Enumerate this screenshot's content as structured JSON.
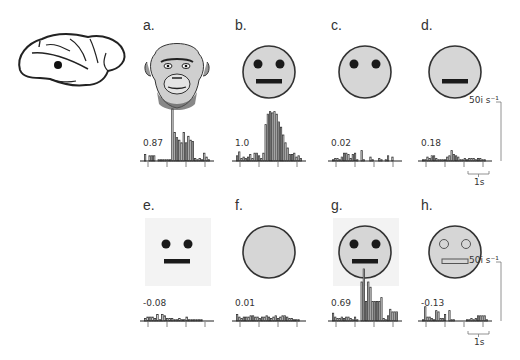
{
  "figure": {
    "panels": [
      {
        "label": "a.",
        "stimulus": "chimpanzee face photo",
        "correlation": "0.87"
      },
      {
        "label": "b.",
        "stimulus": "cartoon face with eyes and mouth",
        "correlation": "1.0"
      },
      {
        "label": "c.",
        "stimulus": "cartoon face eyes only",
        "correlation": "0.02"
      },
      {
        "label": "d.",
        "stimulus": "cartoon face mouth only",
        "correlation": "0.18"
      },
      {
        "label": "e.",
        "stimulus": "eyes and mouth without outline",
        "correlation": "-0.08"
      },
      {
        "label": "f.",
        "stimulus": "outline only",
        "correlation": "0.01"
      },
      {
        "label": "g.",
        "stimulus": "face with square background",
        "correlation": "0.69"
      },
      {
        "label": "h.",
        "stimulus": "face with outlined features",
        "correlation": "-0.13"
      }
    ],
    "scale_bar": {
      "rate": "50i s⁻¹",
      "time": "1s"
    },
    "brain": {
      "icon": "brain-lateral-view-icon",
      "recording_site": "temporal cortex dot"
    }
  },
  "chart_data": [
    {
      "type": "bar",
      "title": "a.",
      "annotation": "0.87",
      "xlabel": "time",
      "ylabel": "spikes/s",
      "values": [
        5,
        0,
        4,
        4,
        4,
        0,
        1,
        1,
        1,
        1,
        1,
        1,
        40,
        22,
        18,
        16,
        14,
        22,
        14,
        19,
        16,
        15,
        2,
        1,
        2,
        1,
        6,
        3,
        1
      ]
    },
    {
      "type": "bar",
      "title": "b.",
      "annotation": "1.0",
      "xlabel": "time",
      "ylabel": "spikes/s",
      "values": [
        4,
        7,
        2,
        3,
        2,
        3,
        5,
        2,
        6,
        6,
        4,
        2,
        6,
        28,
        36,
        38,
        37,
        38,
        36,
        30,
        26,
        20,
        14,
        10,
        5,
        5,
        6,
        3,
        4,
        2
      ]
    },
    {
      "type": "bar",
      "title": "c.",
      "annotation": "0.02",
      "xlabel": "time",
      "ylabel": "spikes/s",
      "values": [
        1,
        2,
        2,
        1,
        3,
        6,
        6,
        5,
        2,
        5,
        6,
        1,
        0,
        8,
        1,
        0,
        0,
        3,
        1,
        0,
        0,
        2,
        1,
        0,
        1,
        4,
        0,
        3,
        0,
        0
      ]
    },
    {
      "type": "bar",
      "title": "d.",
      "annotation": "0.18",
      "xlabel": "time",
      "ylabel": "spikes/s",
      "values": [
        1,
        1,
        3,
        2,
        4,
        4,
        2,
        1,
        1,
        1,
        1,
        3,
        4,
        8,
        5,
        4,
        3,
        1,
        1,
        2,
        1,
        2,
        2,
        2,
        1,
        2,
        2,
        1,
        1,
        0
      ]
    },
    {
      "type": "bar",
      "title": "e.",
      "annotation": "-0.08",
      "xlabel": "time",
      "ylabel": "spikes/s",
      "values": [
        2,
        3,
        3,
        3,
        2,
        5,
        1,
        5,
        4,
        2,
        2,
        2,
        1,
        1,
        2,
        1,
        1,
        3,
        1,
        1,
        1,
        1,
        1,
        1,
        0,
        0,
        0
      ]
    },
    {
      "type": "bar",
      "title": "f.",
      "annotation": "0.01",
      "xlabel": "time",
      "ylabel": "spikes/s",
      "values": [
        5,
        3,
        2,
        3,
        3,
        3,
        4,
        4,
        3,
        3,
        2,
        3,
        3,
        4,
        3,
        2,
        3,
        4,
        2,
        3,
        4,
        4,
        3,
        2,
        2,
        1,
        1,
        1,
        0
      ]
    },
    {
      "type": "bar",
      "title": "g.",
      "annotation": "0.69",
      "xlabel": "time",
      "ylabel": "spikes/s",
      "values": [
        6,
        3,
        2,
        2,
        3,
        2,
        3,
        3,
        2,
        1,
        3,
        1,
        0,
        30,
        40,
        15,
        30,
        26,
        15,
        15,
        15,
        15,
        18,
        2,
        1,
        4,
        9,
        7,
        7,
        7
      ]
    },
    {
      "type": "bar",
      "title": "h.",
      "annotation": "-0.13",
      "xlabel": "time",
      "ylabel": "spikes/s",
      "values": [
        1,
        11,
        3,
        3,
        2,
        1,
        8,
        7,
        2,
        2,
        5,
        0,
        8,
        1,
        1,
        0,
        0,
        0,
        0,
        0,
        1,
        1,
        2,
        1,
        2,
        4,
        4,
        4,
        4,
        1
      ]
    }
  ]
}
